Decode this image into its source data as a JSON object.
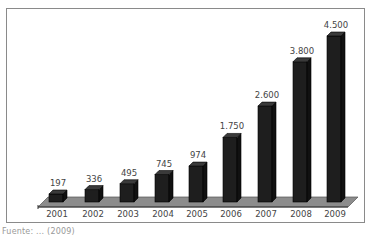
{
  "chart_data": {
    "type": "bar",
    "title": "",
    "xlabel": "",
    "ylabel": "",
    "categories": [
      "2001",
      "2002",
      "2003",
      "2004",
      "2005",
      "2006",
      "2007",
      "2008",
      "2009"
    ],
    "values": [
      197,
      336,
      495,
      745,
      974,
      1750,
      2600,
      3800,
      4500
    ],
    "value_labels": [
      "197",
      "336",
      "495",
      "745",
      "974",
      "1.750",
      "2.600",
      "3.800",
      "4.500"
    ],
    "ylim": [
      0,
      4500
    ],
    "grid": false,
    "legend": null,
    "style": "3d-column",
    "bar_color": "#1e1e1e",
    "floor_color": "#8c8c8c"
  },
  "caption": "Fuente: ... (2009)"
}
